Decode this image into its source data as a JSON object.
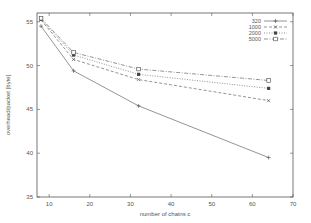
{
  "chart_data": {
    "type": "line",
    "title": "",
    "xlabel": "number of chains c",
    "ylabel": "overhead/packet [byte]",
    "xlim": [
      7,
      70
    ],
    "ylim": [
      35,
      56
    ],
    "xticks": [
      10,
      20,
      30,
      40,
      50,
      60,
      70
    ],
    "yticks": [
      35,
      40,
      45,
      50,
      55
    ],
    "grid": false,
    "legend_position": "top-right",
    "x": [
      8,
      16,
      32,
      64
    ],
    "series": [
      {
        "name": "320",
        "values": [
          54.5,
          49.4,
          45.4,
          39.5
        ],
        "style": "solid",
        "marker": "plus"
      },
      {
        "name": "1000",
        "values": [
          55.2,
          50.7,
          48.4,
          46.0
        ],
        "style": "dashed",
        "marker": "cross"
      },
      {
        "name": "2000",
        "values": [
          55.3,
          51.2,
          49.0,
          47.4
        ],
        "style": "dotted",
        "marker": "filled-square"
      },
      {
        "name": "5000",
        "values": [
          55.4,
          51.5,
          49.6,
          48.3
        ],
        "style": "dashdot",
        "marker": "open-square"
      }
    ]
  }
}
